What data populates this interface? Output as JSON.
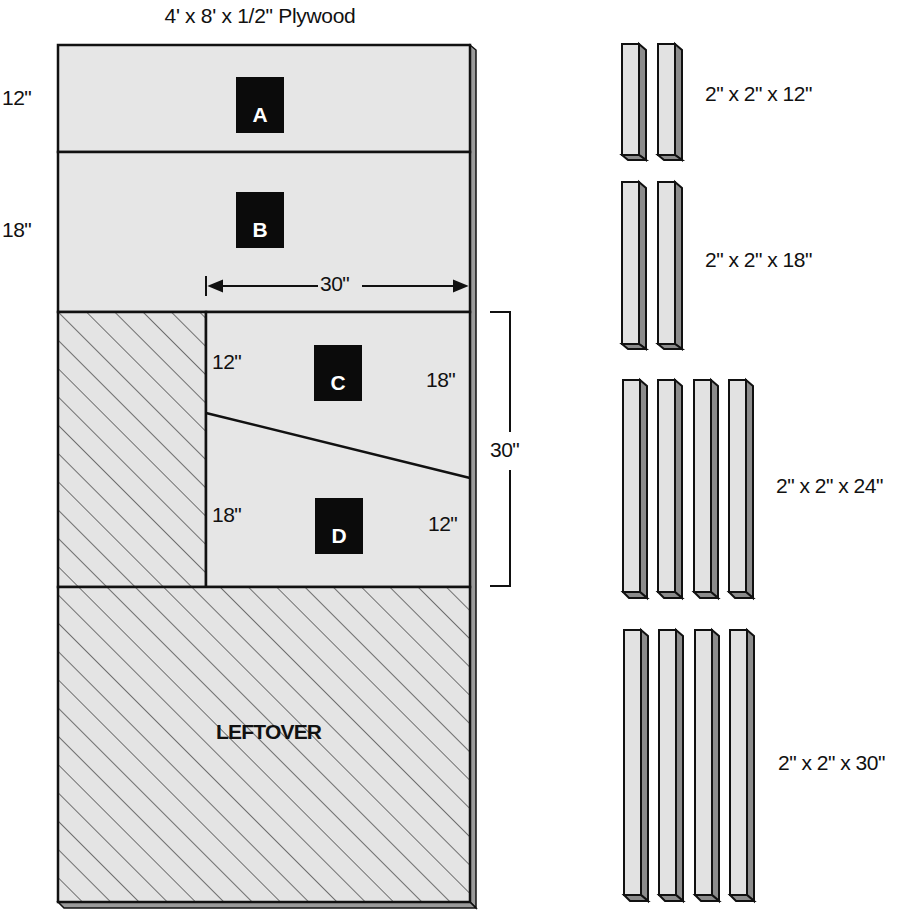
{
  "title": "4' x 8' x 1/2\" Plywood",
  "colors": {
    "panel_fill": "#e6e6e6",
    "outline": "#111111",
    "tag_bg": "#0b0b0b",
    "tag_text": "#ffffff",
    "bar_front": "#e2e2e2",
    "bar_side": "#8c8c8c"
  },
  "plywood": {
    "pieces": [
      {
        "id": "A",
        "label": "A",
        "height_label": "12\""
      },
      {
        "id": "B",
        "label": "B",
        "height_label": "18\"",
        "width_label": "30\""
      },
      {
        "id": "C",
        "label": "C",
        "left_label": "12\"",
        "right_label": "18\""
      },
      {
        "id": "D",
        "label": "D",
        "left_label": "18\"",
        "right_label": "12\""
      }
    ],
    "cd_height_label": "30\"",
    "leftover_label": "LEFTOVER"
  },
  "stock": [
    {
      "label": "2\" x 2\" x 12\"",
      "count": 2
    },
    {
      "label": "2\" x 2\" x 18\"",
      "count": 2
    },
    {
      "label": "2\" x 2\" x 24\"",
      "count": 4
    },
    {
      "label": "2\" x 2\" x 30\"",
      "count": 4
    }
  ]
}
